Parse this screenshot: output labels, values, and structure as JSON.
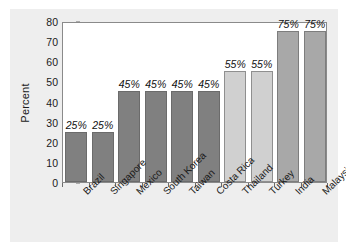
{
  "chart_data": {
    "type": "bar",
    "title": "",
    "xlabel": "",
    "ylabel": "Percent",
    "ylim": [
      0,
      80
    ],
    "yticks": [
      0,
      10,
      20,
      30,
      40,
      50,
      60,
      70,
      80
    ],
    "grid": false,
    "legend": null,
    "categories": [
      "Brazil",
      "Singapore",
      "Mexico",
      "South Korea",
      "Taiwan",
      "Costa Rica",
      "Thailand",
      "Turkey",
      "India",
      "Malaysia"
    ],
    "values": [
      25,
      25,
      45,
      45,
      45,
      45,
      55,
      55,
      75,
      75
    ],
    "data_labels": [
      "25%",
      "25%",
      "45%",
      "45%",
      "45%",
      "45%",
      "55%",
      "55%",
      "75%",
      "75%"
    ],
    "bar_colors": [
      "#808080",
      "#808080",
      "#808080",
      "#808080",
      "#808080",
      "#808080",
      "#d0d0d0",
      "#d0d0d0",
      "#a8a8a8",
      "#a8a8a8"
    ]
  },
  "colors": {
    "panel_background": "#eeeeee",
    "plot_background": "#ffffff",
    "axis_line": "#8a8a8a",
    "text": "#1a1a1a",
    "bar_dark": "#808080",
    "bar_light": "#d0d0d0",
    "bar_medium": "#a8a8a8"
  }
}
